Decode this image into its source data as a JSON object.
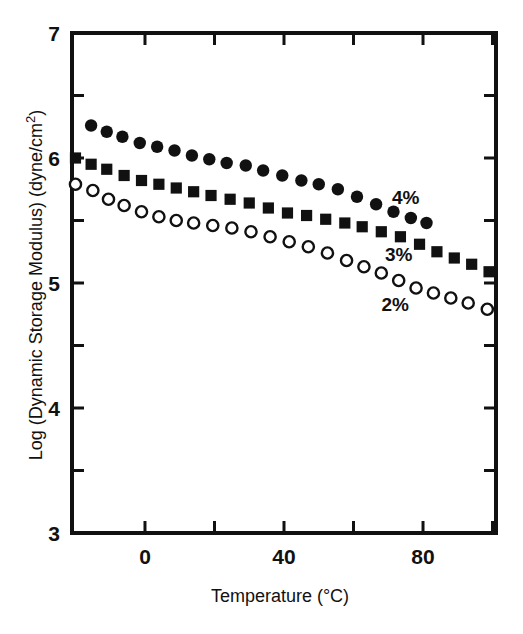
{
  "figure": {
    "background_color": "#ffffff",
    "ink_color": "#111111",
    "width": 523,
    "height": 634
  },
  "axes": {
    "x_title": "Temperature (°C)",
    "y_title_main": "Log (Dynamic Storage Modulus) (dyne/cm",
    "y_title_sup": "2",
    "y_title_tail": ")",
    "x_tick_labels": [
      "0",
      "40",
      "80"
    ],
    "y_tick_labels": [
      "7",
      "6",
      "5",
      "4",
      "3"
    ]
  },
  "annotations": [
    {
      "name": "label-4-percent",
      "text": "4%",
      "x": 75,
      "y": 5.63
    },
    {
      "name": "label-3-percent",
      "text": "3%",
      "x": 73,
      "y": 5.18
    },
    {
      "name": "label-2-percent",
      "text": "2%",
      "x": 72,
      "y": 4.78
    }
  ],
  "chart_data": {
    "type": "scatter",
    "title": "",
    "xlabel": "Temperature (°C)",
    "ylabel": "Log (Dynamic Storage Modulus) (dyne/cm2)",
    "xlim": [
      -21,
      101
    ],
    "ylim": [
      3,
      7
    ],
    "x_major_ticks": [
      0,
      20,
      40,
      60,
      80,
      100
    ],
    "x_labeled_ticks": [
      0,
      40,
      80
    ],
    "y_major_ticks": [
      3,
      4,
      5,
      6,
      7
    ],
    "y_minor_ticks": [
      3.5,
      4.5,
      5.5,
      6.5
    ],
    "grid": false,
    "legend": "inline-annotations",
    "series": [
      {
        "name": "4%",
        "marker": "filled-circle",
        "color": "#111111",
        "points": [
          {
            "x": -15.5,
            "y": 6.26
          },
          {
            "x": -11.0,
            "y": 6.21
          },
          {
            "x": -6.5,
            "y": 6.17
          },
          {
            "x": -1.5,
            "y": 6.12
          },
          {
            "x": 3.5,
            "y": 6.09
          },
          {
            "x": 8.5,
            "y": 6.06
          },
          {
            "x": 13.5,
            "y": 6.02
          },
          {
            "x": 18.5,
            "y": 5.99
          },
          {
            "x": 23.5,
            "y": 5.96
          },
          {
            "x": 29.0,
            "y": 5.94
          },
          {
            "x": 34.0,
            "y": 5.9
          },
          {
            "x": 39.5,
            "y": 5.86
          },
          {
            "x": 45.0,
            "y": 5.82
          },
          {
            "x": 50.0,
            "y": 5.79
          },
          {
            "x": 55.5,
            "y": 5.75
          },
          {
            "x": 61.0,
            "y": 5.69
          },
          {
            "x": 66.5,
            "y": 5.63
          },
          {
            "x": 71.5,
            "y": 5.57
          },
          {
            "x": 76.5,
            "y": 5.52
          },
          {
            "x": 81.0,
            "y": 5.48
          }
        ]
      },
      {
        "name": "3%",
        "marker": "filled-square",
        "color": "#111111",
        "points": [
          {
            "x": -20.0,
            "y": 6.0
          },
          {
            "x": -15.5,
            "y": 5.95
          },
          {
            "x": -11.0,
            "y": 5.91
          },
          {
            "x": -6.0,
            "y": 5.86
          },
          {
            "x": -1.0,
            "y": 5.82
          },
          {
            "x": 4.0,
            "y": 5.79
          },
          {
            "x": 9.0,
            "y": 5.76
          },
          {
            "x": 14.0,
            "y": 5.73
          },
          {
            "x": 19.0,
            "y": 5.7
          },
          {
            "x": 24.5,
            "y": 5.67
          },
          {
            "x": 30.0,
            "y": 5.64
          },
          {
            "x": 35.5,
            "y": 5.6
          },
          {
            "x": 41.0,
            "y": 5.56
          },
          {
            "x": 46.5,
            "y": 5.54
          },
          {
            "x": 52.0,
            "y": 5.51
          },
          {
            "x": 57.5,
            "y": 5.48
          },
          {
            "x": 62.5,
            "y": 5.45
          },
          {
            "x": 68.0,
            "y": 5.41
          },
          {
            "x": 73.5,
            "y": 5.37
          },
          {
            "x": 79.0,
            "y": 5.31
          },
          {
            "x": 84.0,
            "y": 5.25
          },
          {
            "x": 89.0,
            "y": 5.2
          },
          {
            "x": 94.0,
            "y": 5.15
          },
          {
            "x": 99.0,
            "y": 5.09
          }
        ]
      },
      {
        "name": "2%",
        "marker": "open-circle",
        "color": "#111111",
        "points": [
          {
            "x": -20.0,
            "y": 5.79
          },
          {
            "x": -15.0,
            "y": 5.74
          },
          {
            "x": -10.5,
            "y": 5.67
          },
          {
            "x": -6.0,
            "y": 5.62
          },
          {
            "x": -1.0,
            "y": 5.57
          },
          {
            "x": 4.0,
            "y": 5.53
          },
          {
            "x": 9.0,
            "y": 5.5
          },
          {
            "x": 14.0,
            "y": 5.48
          },
          {
            "x": 19.5,
            "y": 5.46
          },
          {
            "x": 25.0,
            "y": 5.44
          },
          {
            "x": 30.5,
            "y": 5.41
          },
          {
            "x": 36.0,
            "y": 5.37
          },
          {
            "x": 41.5,
            "y": 5.33
          },
          {
            "x": 47.0,
            "y": 5.29
          },
          {
            "x": 52.5,
            "y": 5.24
          },
          {
            "x": 58.0,
            "y": 5.18
          },
          {
            "x": 63.0,
            "y": 5.13
          },
          {
            "x": 68.0,
            "y": 5.08
          },
          {
            "x": 73.0,
            "y": 5.02
          },
          {
            "x": 78.0,
            "y": 4.96
          },
          {
            "x": 83.0,
            "y": 4.92
          },
          {
            "x": 88.0,
            "y": 4.88
          },
          {
            "x": 93.0,
            "y": 4.84
          },
          {
            "x": 98.5,
            "y": 4.79
          }
        ]
      }
    ]
  }
}
